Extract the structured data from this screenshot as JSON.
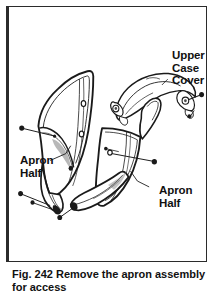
{
  "figure": {
    "caption_number": "Fig. 242",
    "caption_text": "Remove the apron assembly for access",
    "full_caption": "Fig. 242  Remove the apron assembly for access"
  },
  "labels": {
    "upper_case_cover": "Upper\nCase\nCover",
    "apron_half_left": "Apron\nHalf",
    "apron_half_right": "Apron\nHalf"
  },
  "colors": {
    "ink": "#1a1a1a",
    "frame": "#2b2b2b",
    "background": "#ffffff",
    "shading": "#8c8c8c"
  },
  "parts": [
    {
      "name": "apron-half-left",
      "label": "Apron Half",
      "screw_count": 4
    },
    {
      "name": "apron-half-right",
      "label": "Apron Half",
      "screw_count": 3
    },
    {
      "name": "upper-case-cover",
      "label": "Upper Case Cover",
      "screw_count": 2
    }
  ]
}
